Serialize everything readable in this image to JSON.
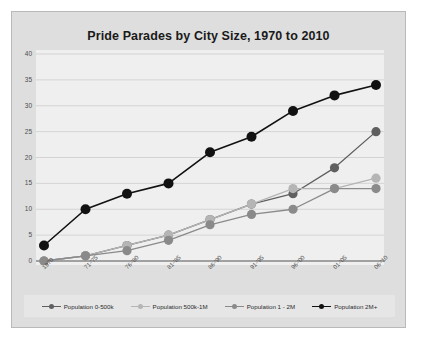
{
  "chart_data": {
    "type": "line",
    "title": "Pride Parades by City Size, 1970 to 2010",
    "xlabel": "",
    "ylabel": "",
    "ylim": [
      0,
      40
    ],
    "yticks": [
      0,
      5,
      10,
      15,
      20,
      25,
      30,
      35,
      40
    ],
    "grid": true,
    "legend_position": "bottom",
    "categories": [
      "1970",
      "71-'75",
      "76-'80",
      "81-'85",
      "86-'90",
      "91-'95",
      "96-'00",
      "01-'05",
      "06-'10"
    ],
    "series": [
      {
        "name": "Population 0-500k",
        "color": "#5f5f5f",
        "values": [
          0,
          1,
          3,
          5,
          8,
          11,
          13,
          18,
          25
        ]
      },
      {
        "name": "Population 500k-1M",
        "color": "#b5b5b5",
        "values": [
          0,
          1,
          3,
          5,
          8,
          11,
          14,
          14,
          16
        ]
      },
      {
        "name": "Population 1 - 2M",
        "color": "#8a8a8a",
        "values": [
          0,
          1,
          2,
          4,
          7,
          9,
          10,
          14,
          14
        ]
      },
      {
        "name": "Population 2M+",
        "color": "#111111",
        "values": [
          3,
          10,
          13,
          15,
          21,
          24,
          29,
          32,
          34
        ]
      }
    ]
  },
  "frame": {
    "background": "#dedede",
    "border": "#b9b9b9",
    "plot_background": "#efefef",
    "gridline_color": "#c9c9c9",
    "axis_color": "#555555",
    "legend_background": "#e6e6e6"
  }
}
